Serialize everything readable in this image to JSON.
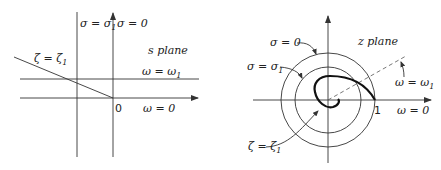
{
  "s_plane": {
    "title": "s plane",
    "labels": {
      "sigma_sigma1": "σ = σ",
      "sigma_sigma1_sub": "1",
      "sigma_zero": "σ = 0",
      "zeta_zeta1": "ζ = ζ",
      "zeta_zeta1_sub": "1",
      "omega_omega1": "ω = ω",
      "omega_omega1_sub": "1",
      "origin": "0",
      "omega_zero": "ω = 0"
    }
  },
  "z_plane": {
    "title": "z plane",
    "labels": {
      "sigma_zero": "σ = 0",
      "sigma_sigma1": "σ = σ",
      "sigma_sigma1_sub": "1",
      "omega_omega1": "ω = ω",
      "omega_omega1_sub": "1",
      "unit": "1",
      "omega_zero": "ω = 0",
      "zeta_zeta1": "ζ = ζ",
      "zeta_zeta1_sub": "1"
    }
  },
  "colors": {
    "line": "#333333",
    "text": "#222222",
    "background": "#ffffff"
  }
}
